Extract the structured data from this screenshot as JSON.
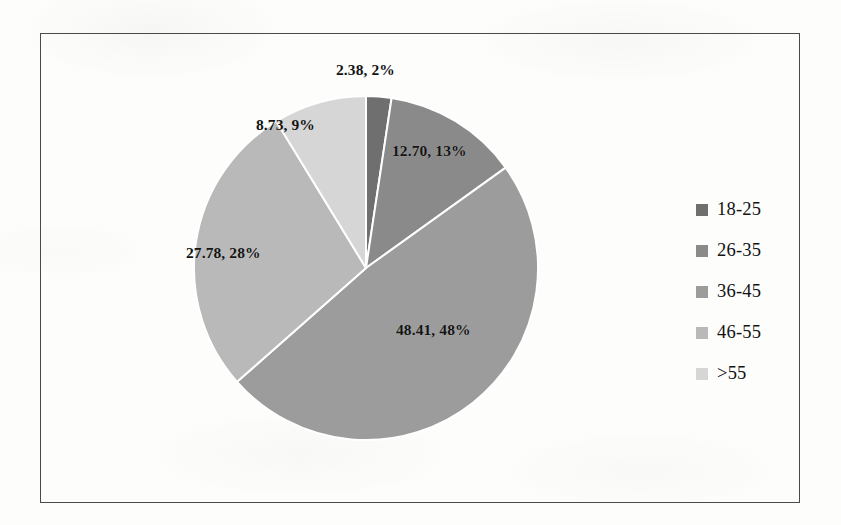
{
  "chart_data": {
    "type": "pie",
    "title": "",
    "subtitle": "",
    "xlabel": "",
    "ylabel": "",
    "grid": false,
    "legend_position": "right",
    "start_angle_deg": 0,
    "direction": "clockwise",
    "categories": [
      "18-25",
      "26-35",
      "36-45",
      "46-55",
      ">55"
    ],
    "values": [
      2.38,
      12.7,
      48.41,
      27.78,
      8.73
    ],
    "percents": [
      2,
      13,
      48,
      28,
      9
    ],
    "colors": [
      "#6f6f6f",
      "#8a8a8a",
      "#9c9c9c",
      "#b9b9b9",
      "#d6d6d6"
    ],
    "slice_separator_color": "#ffffff",
    "data_labels": [
      "2.38, 2%",
      "12.70, 13%",
      "48.41, 48%",
      "27.78, 28%",
      "8.73, 9%"
    ]
  },
  "chart": {
    "border_color": "#4a4a4a",
    "background": "#fdfdfc",
    "labels": {
      "l0": "2.38, 2%",
      "l1": "12.70, 13%",
      "l2": "48.41, 48%",
      "l3": "27.78, 28%",
      "l4": "8.73, 9%"
    }
  },
  "legend": {
    "items": [
      {
        "label": "18-25",
        "color": "#6f6f6f"
      },
      {
        "label": "26-35",
        "color": "#8a8a8a"
      },
      {
        "label": "36-45",
        "color": "#9c9c9c"
      },
      {
        "label": "46-55",
        "color": "#b9b9b9"
      },
      {
        "label": ">55",
        "color": "#d6d6d6"
      }
    ]
  }
}
